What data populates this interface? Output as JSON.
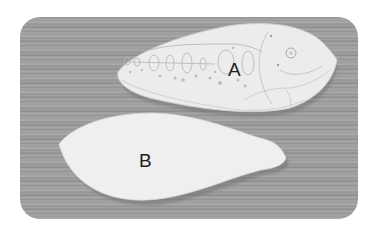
{
  "image": {
    "description": "Grayscale photo of two fish-shaped objects on wood-grain surface",
    "background_color": "#ffffff",
    "wood_color": "#9c9c9c"
  },
  "objects": [
    {
      "id": "A",
      "label": "A",
      "description": "carved fish with engraved decorative pattern (circles, ovals, head with eye)",
      "fill": "#ececec"
    },
    {
      "id": "B",
      "label": "B",
      "description": "plain smooth fish-shaped cutout",
      "fill": "#efefef"
    }
  ]
}
